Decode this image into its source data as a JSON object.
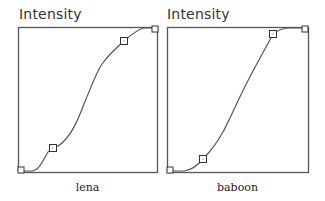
{
  "panels": [
    {
      "title": "Intensity",
      "caption": "lena",
      "box": {
        "x": 18,
        "y": 27,
        "w": 139,
        "h": 145
      },
      "curve_path": "M20,171 L32,171 C40,170 44,158 48,152 C52,148 58,147 62,143 C72,134 78,120 84,104 C90,90 95,75 102,64 C108,56 116,48 124,41 C132,34 138,29 144,28 L156,28",
      "control_points": [
        {
          "x": 21,
          "y": 170,
          "size": 6
        },
        {
          "x": 53,
          "y": 148,
          "size": 7
        },
        {
          "x": 124,
          "y": 41,
          "size": 7
        },
        {
          "x": 155,
          "y": 29,
          "size": 6
        }
      ]
    },
    {
      "title": "Intensity",
      "caption": "baboon",
      "box": {
        "x": 167,
        "y": 27,
        "w": 141,
        "h": 145
      },
      "curve_path": "M169,171 L184,171 C192,170 198,165 203,159 C212,150 222,136 230,118 C240,96 250,76 260,58 C266,47 270,40 273,34 C278,30 282,28 290,28 L306,28",
      "control_points": [
        {
          "x": 170,
          "y": 170,
          "size": 6
        },
        {
          "x": 203,
          "y": 159,
          "size": 7
        },
        {
          "x": 273,
          "y": 34,
          "size": 7
        },
        {
          "x": 305,
          "y": 29,
          "size": 6
        }
      ]
    }
  ],
  "colors": {
    "box_stroke": "#555555",
    "curve": "#555555",
    "flat_segment": "#222222"
  }
}
